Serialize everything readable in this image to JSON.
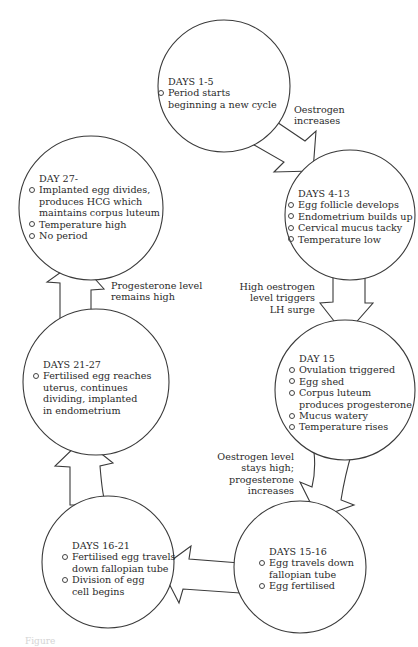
{
  "diagram": {
    "stages": [
      {
        "title": "DAYS 1-5",
        "items": [
          "Period starts beginning a new cycle"
        ]
      },
      {
        "title": "DAYS 4-13",
        "items": [
          "Egg follicle develops",
          "Endometrium builds up",
          "Cervical mucus tacky",
          "Temperature low"
        ]
      },
      {
        "title": "DAY 15",
        "items": [
          "Ovulation triggered",
          "Egg shed",
          "Corpus luteum produces progesterone",
          "Mucus watery",
          "Temperature rises"
        ]
      },
      {
        "title": "DAYS 15-16",
        "items": [
          "Egg travels down fallopian tube",
          "Egg fertilised"
        ]
      },
      {
        "title": "DAYS 16-21",
        "items": [
          "Fertilised egg travels down fallopian tube",
          "Division of egg cell begins"
        ]
      },
      {
        "title": "DAYS 21-27",
        "items": [
          "Fertilised egg reaches uterus, continues dividing, implanted in endometrium"
        ]
      },
      {
        "title": "DAY 27-",
        "items": [
          "Implanted egg divides, produces HCG which maintains corpus luteum",
          "Temperature high",
          "No period"
        ]
      }
    ],
    "transitions": [
      {
        "from": "DAYS 1-5",
        "to": "DAYS 4-13",
        "label": "Oestrogen increases"
      },
      {
        "from": "DAYS 4-13",
        "to": "DAY 15",
        "label": "High oestrogen level triggers LH surge"
      },
      {
        "from": "DAY 15",
        "to": "DAYS 15-16",
        "label": "Oestrogen level stays high; progesterone increases"
      },
      {
        "from": "DAYS 15-16",
        "to": "DAYS 16-21",
        "label": ""
      },
      {
        "from": "DAYS 16-21",
        "to": "DAYS 21-27",
        "label": ""
      },
      {
        "from": "DAYS 21-27",
        "to": "DAY 27-",
        "label": "Progesterone level remains high"
      }
    ],
    "caption": "Figure"
  },
  "text": {
    "s1": {
      "title": "DAYS 1-5",
      "l1": "Period starts",
      "l2": "beginning a new cycle"
    },
    "s2": {
      "title": "DAYS 4-13",
      "b1": "Egg follicle develops",
      "b2": "Endometrium builds up",
      "b3": "Cervical mucus tacky",
      "b4": "Temperature low"
    },
    "s3": {
      "title": "DAY 15",
      "b1": "Ovulation triggered",
      "b2": "Egg shed",
      "b3a": "Corpus luteum",
      "b3b": "produces progesterone",
      "b4": "Mucus watery",
      "b5": "Temperature rises"
    },
    "s4": {
      "title": "DAYS 15-16",
      "b1a": "Egg travels down",
      "b1b": "fallopian tube",
      "b2": "Egg fertilised"
    },
    "s5": {
      "title": "DAYS 16-21",
      "b1a": "Fertilised egg travels",
      "b1b": "down fallopian tube",
      "b2a": "Division of egg",
      "b2b": "cell begins"
    },
    "s6": {
      "title": "DAYS 21-27",
      "b1a": "Fertilised egg reaches",
      "b1b": "uterus, continues",
      "b1c": "dividing, implanted",
      "b1d": "in endometrium"
    },
    "s7": {
      "title": "DAY 27-",
      "b1a": "Implanted egg divides,",
      "b1b": "produces HCG which",
      "b1c": "maintains corpus luteum",
      "b2": "Temperature high",
      "b3": "No period"
    },
    "t1": {
      "l1": "Oestrogen",
      "l2": "increases"
    },
    "t2": {
      "l1": "High oestrogen",
      "l2": "level triggers",
      "l3": "LH surge"
    },
    "t3": {
      "l1": "Oestrogen level",
      "l2": "stays high;",
      "l3": "progesterone",
      "l4": "increases"
    },
    "t6": {
      "l1": "Progesterone level",
      "l2": "remains high"
    }
  }
}
